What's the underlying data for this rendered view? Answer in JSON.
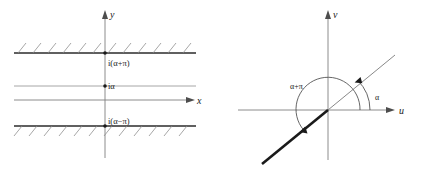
{
  "figure": {
    "title": "",
    "panels": [
      {
        "id": "z-plane",
        "name": "left-plane-strip",
        "axes": {
          "x_label": "x",
          "y_label": "y"
        },
        "labels": {
          "upper_boundary": "i(α+π)",
          "center_line": "iα",
          "lower_boundary": "i(α−π)"
        },
        "marked_points": [
          "i(α+π)",
          "iα",
          "i(α−π)"
        ],
        "hatched_boundaries": 2,
        "hatch_count_upper": 12,
        "hatch_count_lower": 12
      },
      {
        "id": "w-plane",
        "name": "right-plane-sector",
        "axes": {
          "x_label": "u",
          "y_label": "v"
        },
        "labels": {
          "inner_angle": "α",
          "outer_angle": "α+π"
        },
        "rays": [
          {
            "name": "thin-ray",
            "angle_label": "α"
          },
          {
            "name": "thick-ray",
            "angle_label": "α+π"
          }
        ]
      }
    ]
  },
  "colors": {
    "ink": "#1a1a1a",
    "axis": "#7f7f7f",
    "boundary": "#2b2b2b",
    "hatch": "#8a8a8a",
    "background": "#ffffff"
  }
}
